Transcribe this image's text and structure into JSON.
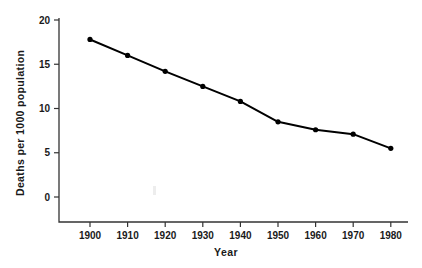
{
  "chart_data": {
    "type": "line",
    "title": "",
    "xlabel": "Year",
    "ylabel": "Deaths per 1000 population",
    "x": [
      1900,
      1910,
      1920,
      1930,
      1940,
      1950,
      1960,
      1970,
      1980
    ],
    "values": [
      17.8,
      16.0,
      14.2,
      12.5,
      10.8,
      8.5,
      7.6,
      7.1,
      5.5
    ],
    "xtick_labels": [
      "1900",
      "1910",
      "1920",
      "1930",
      "1940",
      "1950",
      "1960",
      "1970",
      "1980"
    ],
    "ytick_labels": [
      "0",
      "5",
      "10",
      "15",
      "20"
    ],
    "ytick_values": [
      0,
      5,
      10,
      15,
      20
    ],
    "xlim": [
      1895,
      1982
    ],
    "ylim": [
      0,
      20
    ],
    "grid": false,
    "legend": false,
    "marker": "filled-circle",
    "line_color": "#000000",
    "marker_color": "#000000",
    "axis_color": "#333333",
    "background_color": "#ffffff"
  },
  "axes": {
    "y_title": "Deaths per 1000 population",
    "x_title": "Year"
  }
}
